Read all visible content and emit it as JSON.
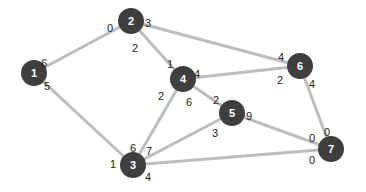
{
  "diagram": {
    "type": "undirected-graph",
    "colors": {
      "node": "#3f3f3f",
      "node_text": "#ffffff",
      "edge": "#bdbdbd",
      "label": "#222222"
    },
    "nodes": [
      {
        "id": "1",
        "label": "1",
        "x": 34,
        "y": 73
      },
      {
        "id": "2",
        "label": "2",
        "x": 131,
        "y": 21
      },
      {
        "id": "3",
        "label": "3",
        "x": 133,
        "y": 165
      },
      {
        "id": "4",
        "label": "4",
        "x": 183,
        "y": 79
      },
      {
        "id": "5",
        "label": "5",
        "x": 232,
        "y": 113
      },
      {
        "id": "6",
        "label": "6",
        "x": 300,
        "y": 66
      },
      {
        "id": "7",
        "label": "7",
        "x": 331,
        "y": 149
      }
    ],
    "edges": [
      {
        "from": "1",
        "to": "2",
        "from_port": "6",
        "to_port": "0"
      },
      {
        "from": "1",
        "to": "3",
        "from_port": "5",
        "to_port": "1"
      },
      {
        "from": "2",
        "to": "6",
        "from_port": "3",
        "to_port": "4"
      },
      {
        "from": "2",
        "to": "4",
        "from_port": "2",
        "to_port": "1"
      },
      {
        "from": "4",
        "to": "6",
        "from_port": "4",
        "to_port": "2"
      },
      {
        "from": "4",
        "to": "3",
        "from_port": "2",
        "to_port": "6"
      },
      {
        "from": "4",
        "to": "5",
        "from_port": "6",
        "to_port": "2"
      },
      {
        "from": "5",
        "to": "3",
        "from_port": "3",
        "to_port": "7"
      },
      {
        "from": "5",
        "to": "7",
        "from_port": "9",
        "to_port": "0"
      },
      {
        "from": "6",
        "to": "7",
        "from_port": "4",
        "to_port": "0"
      },
      {
        "from": "3",
        "to": "7",
        "from_port": "4",
        "to_port": "0"
      }
    ],
    "port_labels": [
      {
        "text": "6",
        "x": 44,
        "y": 63
      },
      {
        "text": "5",
        "x": 47,
        "y": 86
      },
      {
        "text": "0",
        "x": 110,
        "y": 28
      },
      {
        "text": "3",
        "x": 148,
        "y": 23
      },
      {
        "text": "2",
        "x": 135,
        "y": 48
      },
      {
        "text": "1",
        "x": 170,
        "y": 64
      },
      {
        "text": "4",
        "x": 197,
        "y": 74
      },
      {
        "text": "2",
        "x": 161,
        "y": 96
      },
      {
        "text": "6",
        "x": 189,
        "y": 102
      },
      {
        "text": "2",
        "x": 216,
        "y": 100
      },
      {
        "text": "9",
        "x": 249,
        "y": 116
      },
      {
        "text": "3",
        "x": 215,
        "y": 133
      },
      {
        "text": "4",
        "x": 281,
        "y": 57
      },
      {
        "text": "2",
        "x": 280,
        "y": 80
      },
      {
        "text": "4",
        "x": 312,
        "y": 84
      },
      {
        "text": "0",
        "x": 312,
        "y": 138
      },
      {
        "text": "0",
        "x": 327,
        "y": 132
      },
      {
        "text": "0",
        "x": 312,
        "y": 160
      },
      {
        "text": "1",
        "x": 113,
        "y": 164
      },
      {
        "text": "6",
        "x": 133,
        "y": 148
      },
      {
        "text": "7",
        "x": 149,
        "y": 151
      },
      {
        "text": "4",
        "x": 148,
        "y": 177
      }
    ]
  }
}
